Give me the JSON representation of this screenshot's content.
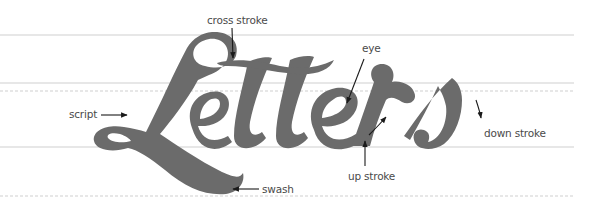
{
  "diagram": {
    "word": "Letters",
    "letter_color": "#6b6b6b",
    "guide_line_color": "#cfcfcf",
    "arrow_color": "#1a1a1a",
    "guide_lines": [
      {
        "name": "ascender-line",
        "y": 35,
        "style": "solid"
      },
      {
        "name": "x-height-line",
        "y": 83,
        "style": "solid"
      },
      {
        "name": "waist-line",
        "y": 91,
        "style": "dashed"
      },
      {
        "name": "baseline",
        "y": 147,
        "style": "solid"
      },
      {
        "name": "descender-line",
        "y": 196,
        "style": "dashed"
      }
    ],
    "labels": {
      "cross_stroke": "cross stroke",
      "eye": "eye",
      "script": "script",
      "down_stroke": "down stroke",
      "up_stroke": "up stroke",
      "swash": "swash"
    }
  }
}
